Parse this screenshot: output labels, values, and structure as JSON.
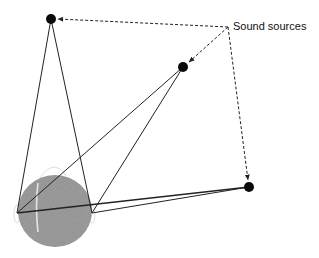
{
  "diagram": {
    "label": "Sound sources",
    "colors": {
      "line": "#222222",
      "dot": "#0a0a0a",
      "head": "#8f8f8f",
      "background": "#ffffff"
    },
    "sources": [
      {
        "id": "source-1",
        "x": 51,
        "y": 19
      },
      {
        "id": "source-2",
        "x": 183,
        "y": 67
      },
      {
        "id": "source-3",
        "x": 249,
        "y": 187
      }
    ],
    "ears": {
      "left": {
        "x": 17,
        "y": 213
      },
      "right": {
        "x": 92,
        "y": 213
      }
    },
    "label_anchor": {
      "x": 228,
      "y": 27
    },
    "head": {
      "cx": 55,
      "cy": 210,
      "r": 37
    }
  }
}
